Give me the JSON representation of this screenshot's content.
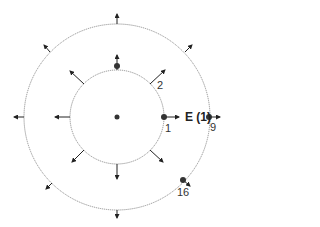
{
  "diagram": {
    "type": "concentric-circles-field-diagram",
    "center": {
      "x": 117,
      "y": 117
    },
    "inner_circle_radius": 47,
    "outer_circle_radius": 93,
    "colors": {
      "circle": "#888888",
      "arrow": "#222222",
      "point": "#333333"
    },
    "labels": {
      "field": "E (1)",
      "point_1": "1",
      "point_2": "2",
      "point_9": "9",
      "point_16": "16"
    }
  }
}
